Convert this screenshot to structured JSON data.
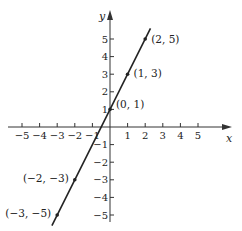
{
  "chart_data": {
    "type": "line",
    "title": "",
    "xlabel": "x",
    "ylabel": "y",
    "xlim": [
      -5,
      5
    ],
    "ylim": [
      -5,
      5
    ],
    "grid": false,
    "x_ticks": [
      -5,
      -4,
      -3,
      -2,
      -1,
      1,
      2,
      3,
      4,
      5
    ],
    "y_ticks": [
      -5,
      -4,
      -3,
      -2,
      -1,
      1,
      2,
      3,
      4,
      5
    ],
    "x_tick_labels": [
      "−5",
      "−4",
      "−3",
      "−2",
      "−1",
      "1",
      "2",
      "3",
      "4",
      "5"
    ],
    "y_tick_labels": [
      "−5",
      "−4",
      "−3",
      "−2",
      "−1",
      "1",
      "2",
      "3",
      "4",
      "5"
    ],
    "series": [
      {
        "name": "y = 2x + 1",
        "line_extent_x": [
          -3.3,
          2.3
        ],
        "points": [
          {
            "x": -3,
            "y": -5,
            "label": "(−3, −5)"
          },
          {
            "x": -2,
            "y": -3,
            "label": "(−2, −3)"
          },
          {
            "x": 0,
            "y": 1,
            "label": "(0, 1)"
          },
          {
            "x": 1,
            "y": 3,
            "label": "(1, 3)"
          },
          {
            "x": 2,
            "y": 5,
            "label": "(2, 5)"
          }
        ]
      }
    ]
  },
  "colors": {
    "axis": "#333333",
    "line": "#222222",
    "background": "#ffffff"
  }
}
